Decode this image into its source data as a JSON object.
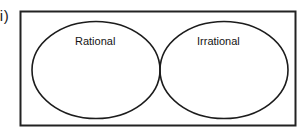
{
  "figure": {
    "item_label": "ii)",
    "type": "venn-diagram",
    "universal_set": {
      "shape": "rectangle",
      "border_color": "#222222",
      "fill_color": "#ffffff"
    },
    "sets": [
      {
        "id": "rational",
        "label": "Rational",
        "shape": "ellipse",
        "stroke_color": "#1c1c1c",
        "fill_color": "none"
      },
      {
        "id": "irrational",
        "label": "Irrational",
        "shape": "ellipse",
        "stroke_color": "#1c1c1c",
        "fill_color": "none"
      }
    ],
    "intersection": {
      "label": "",
      "shaded": false
    }
  },
  "colors": {
    "background": "#ffffff",
    "stroke": "#1c1c1c",
    "text": "#141414"
  }
}
